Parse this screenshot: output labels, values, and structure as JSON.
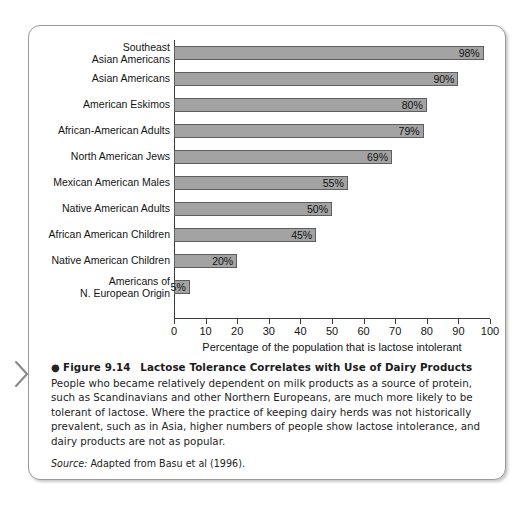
{
  "figure": {
    "label": "Figure 9.14",
    "bullet": "●",
    "title": "Lactose Tolerance Correlates with Use of Dairy Products",
    "body": " People who became relatively dependent on milk products as a source of protein, such as Scandinavians and other Northern Europeans, are much more likely to be tolerant of lactose. Where the practice of keeping dairy herds was not historically prevalent, such as in Asia, higher numbers of people show lactose intolerance, and dairy products are not as popular.",
    "source_word": "Source:",
    "source_text": " Adapted from Basu et al (1996)."
  },
  "chart_data": {
    "type": "bar",
    "orientation": "horizontal",
    "title": "",
    "xlabel": "Percentage of the population that is lactose intolerant",
    "ylabel": "",
    "xlim": [
      0,
      100
    ],
    "grid": false,
    "legend": null,
    "bar_color": "#a3a3a3",
    "bar_border_color": "#5e5e5e",
    "categories": [
      "Southeast\nAsian Americans",
      "Asian Americans",
      "American Eskimos",
      "African-American Adults",
      "North American Jews",
      "Mexican American Males",
      "Native American Adults",
      "African American Children",
      "Native American Children",
      "Americans of\nN. European Origin"
    ],
    "values": [
      98,
      90,
      80,
      79,
      69,
      55,
      50,
      45,
      20,
      5
    ],
    "value_labels": [
      "98%",
      "90%",
      "80%",
      "79%",
      "69%",
      "55%",
      "50%",
      "45%",
      "20%",
      "5%"
    ],
    "xticks": [
      0,
      10,
      20,
      30,
      40,
      50,
      60,
      70,
      80,
      90,
      100
    ],
    "xtick_labels": [
      "0",
      "10",
      "20",
      "30",
      "40",
      "50",
      "60",
      "70",
      "80",
      "90",
      "100"
    ]
  }
}
